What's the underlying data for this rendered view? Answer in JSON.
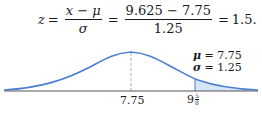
{
  "equation": {
    "lhs": "z",
    "eq1": "=",
    "frac1": {
      "numerator": "x − μ",
      "denominator": "σ"
    },
    "eq2": "=",
    "frac2": {
      "numerator": "9.625 − 7.75",
      "denominator": "1.25"
    },
    "eq3": "=",
    "result": "1.5."
  },
  "parameters": {
    "mu_symbol": "μ",
    "mu_text": " = 7.75",
    "sigma_symbol": "σ",
    "sigma_text": " = 1.25"
  },
  "axis": {
    "mean_label": "7.75",
    "x_label_whole": "9",
    "x_label_num": "5",
    "x_label_den": "8"
  },
  "colors": {
    "curve": "#4a7fd0",
    "shade": "#d6e6f7",
    "axis": "#555555",
    "mean_line": "#8fb0e0"
  }
}
